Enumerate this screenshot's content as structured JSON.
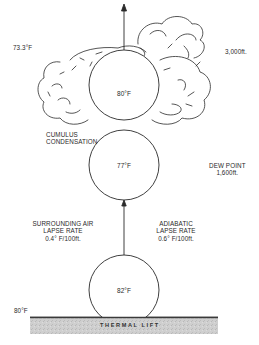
{
  "diagram": {
    "labels": {
      "top_left_temp": "73.3°F",
      "top_right_altitude": "3,000ft.",
      "cloud_parcel_temp": "80°F",
      "condensation_line1": "CUMULUS",
      "condensation_line2": "CONDENSATION",
      "middle_parcel_temp": "77°F",
      "dew_point_line1": "DEW POINT",
      "dew_point_line2": "1,600ft.",
      "surrounding_line1": "SURROUNDING AIR",
      "surrounding_line2": "LAPSE RATE",
      "surrounding_line3": "0.4° F/100ft.",
      "adiabatic_line1": "ADIABATIC",
      "adiabatic_line2": "LAPSE RATE",
      "adiabatic_line3": "0.6° F/100ft.",
      "bottom_parcel_temp": "82°F",
      "ground_temp": "80°F",
      "ground_label": "THERMAL LIFT"
    },
    "colors": {
      "line": "#2a2a2a",
      "ground_fill": "#c9c9c9",
      "ground_edge": "#3a3a3a",
      "background": "#ffffff"
    },
    "elements": {
      "parcels": [
        {
          "name": "cloud-parcel",
          "temp": "80°F",
          "cx": 124,
          "cy": 85,
          "r": 35
        },
        {
          "name": "middle-parcel",
          "temp": "77°F",
          "cx": 124,
          "cy": 165,
          "r": 35
        },
        {
          "name": "bottom-parcel",
          "temp": "82°F",
          "cx": 124,
          "cy": 291,
          "r": 35
        }
      ]
    }
  }
}
